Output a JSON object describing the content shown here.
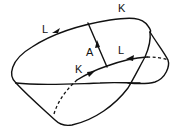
{
  "diagram": {
    "type": "surface-with-curves",
    "labels": {
      "K_top": "K",
      "L_left": "L",
      "A_arc": "A",
      "L_inner": "L",
      "K_inner": "K"
    },
    "colors": {
      "stroke": "#111111",
      "background": "#ffffff"
    }
  }
}
